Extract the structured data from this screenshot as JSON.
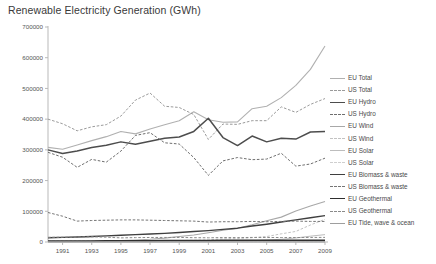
{
  "chart_data": {
    "type": "line",
    "title": "Renewable Electricity Generation (GWh)",
    "xlabel": "",
    "ylabel": "",
    "grid": false,
    "legend_position": "right",
    "xlim": [
      1990,
      2009
    ],
    "ylim": [
      0,
      700000
    ],
    "ytick_labels": [
      "0",
      "100000",
      "200000",
      "300000",
      "400000",
      "500000",
      "600000",
      "700000"
    ],
    "yticks": [
      0,
      100000,
      200000,
      300000,
      400000,
      500000,
      600000,
      700000
    ],
    "xtick_labels": [
      "1991",
      "1993",
      "1995",
      "1997",
      "1999",
      "2001",
      "2003",
      "2005",
      "2007",
      "2009"
    ],
    "xticks": [
      1991,
      1993,
      1995,
      1997,
      1999,
      2001,
      2003,
      2005,
      2007,
      2009
    ],
    "x": [
      1990,
      1991,
      1992,
      1993,
      1994,
      1995,
      1996,
      1997,
      1998,
      1999,
      2000,
      2001,
      2002,
      2003,
      2004,
      2005,
      2006,
      2007,
      2008,
      2009
    ],
    "series": [
      {
        "name": "EU Total",
        "color": "#b0b0b0",
        "dash": "solid",
        "width": 1.1,
        "values": [
          308000,
          302000,
          316000,
          330000,
          343000,
          360000,
          352000,
          368000,
          382000,
          395000,
          424000,
          398000,
          390000,
          391000,
          434000,
          442000,
          470000,
          510000,
          562000,
          638000
        ]
      },
      {
        "name": "US Total",
        "color": "#9a9a9a",
        "dash": "dashed",
        "width": 1.0,
        "values": [
          400000,
          385000,
          362000,
          375000,
          382000,
          410000,
          462000,
          485000,
          442000,
          438000,
          415000,
          334000,
          384000,
          383000,
          395000,
          395000,
          440000,
          422000,
          448000,
          467000
        ]
      },
      {
        "name": "EU Hydro",
        "color": "#4d4d4d",
        "dash": "solid",
        "width": 1.5,
        "values": [
          300000,
          288000,
          296000,
          308000,
          315000,
          326000,
          318000,
          328000,
          338000,
          342000,
          360000,
          403000,
          340000,
          314000,
          345000,
          326000,
          338000,
          335000,
          358000,
          360000
        ]
      },
      {
        "name": "US Hydro",
        "color": "#6e6e6e",
        "dash": "dashed",
        "width": 1.0,
        "values": [
          292000,
          276000,
          243000,
          269000,
          260000,
          296000,
          347000,
          356000,
          323000,
          319000,
          275000,
          217000,
          264000,
          275000,
          268000,
          270000,
          289000,
          247000,
          254000,
          273000
        ]
      },
      {
        "name": "EU Wind",
        "color": "#a8a8a8",
        "dash": "solid",
        "width": 1.1,
        "values": [
          800,
          1200,
          1800,
          2600,
          3600,
          5000,
          6700,
          9000,
          12500,
          18000,
          23000,
          30000,
          38000,
          45000,
          56000,
          69000,
          81000,
          101000,
          117000,
          132000
        ]
      },
      {
        "name": "US Wind",
        "color": "#c2c2c2",
        "dash": "dashed",
        "width": 1.0,
        "values": [
          2800,
          2900,
          2900,
          3000,
          3400,
          3200,
          3300,
          3300,
          3000,
          4500,
          5600,
          6700,
          10400,
          11200,
          14100,
          17800,
          26600,
          34400,
          55400,
          73900
        ]
      },
      {
        "name": "EU Solar",
        "color": "#bdbdbd",
        "dash": "solid",
        "width": 1.0,
        "values": [
          100,
          120,
          150,
          180,
          220,
          280,
          350,
          450,
          600,
          800,
          1100,
          1500,
          2100,
          3000,
          4300,
          6200,
          9000,
          13000,
          19000,
          24000
        ]
      },
      {
        "name": "US Solar",
        "color": "#cfcfcf",
        "dash": "dashed",
        "width": 1.0,
        "values": [
          600,
          700,
          800,
          850,
          900,
          900,
          900,
          900,
          900,
          900,
          900,
          900,
          900,
          900,
          900,
          900,
          900,
          900,
          900,
          900
        ]
      },
      {
        "name": "EU Biomass & waste",
        "color": "#3f3f3f",
        "dash": "solid",
        "width": 1.4,
        "values": [
          14000,
          15000,
          16500,
          18000,
          20000,
          22000,
          24000,
          26000,
          28000,
          31000,
          34000,
          37000,
          41000,
          45000,
          52000,
          58000,
          65000,
          72000,
          79000,
          86000
        ]
      },
      {
        "name": "US Biomass & waste",
        "color": "#757575",
        "dash": "dashed",
        "width": 1.0,
        "values": [
          96000,
          84000,
          68000,
          70000,
          71000,
          72000,
          72000,
          71000,
          70000,
          69000,
          68000,
          65000,
          66000,
          66000,
          67000,
          66000,
          67000,
          68000,
          67000,
          67000
        ]
      },
      {
        "name": "EU Geothermal",
        "color": "#2e2e2e",
        "dash": "solid",
        "width": 1.5,
        "values": [
          3200,
          3400,
          3500,
          3600,
          3800,
          4000,
          4200,
          4400,
          4600,
          4800,
          5000,
          5200,
          5400,
          5500,
          5600,
          5700,
          5800,
          5900,
          5900,
          6000
        ]
      },
      {
        "name": "US Geothermal",
        "color": "#8a8a8a",
        "dash": "dashed",
        "width": 1.0,
        "values": [
          15400,
          15700,
          16100,
          16800,
          15700,
          13400,
          14300,
          14700,
          14800,
          14800,
          14100,
          13700,
          14500,
          14400,
          14800,
          14700,
          14600,
          14600,
          14800,
          15000
        ]
      },
      {
        "name": "EU Tide, wave & ocean",
        "color": "#9e9e9e",
        "dash": "solid",
        "width": 1.1,
        "values": [
          520,
          520,
          530,
          530,
          540,
          540,
          540,
          540,
          540,
          540,
          540,
          540,
          540,
          530,
          530,
          520,
          520,
          510,
          510,
          500
        ]
      }
    ]
  }
}
